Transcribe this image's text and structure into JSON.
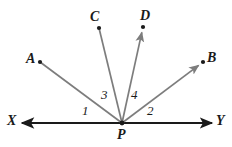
{
  "figure": {
    "width": 232,
    "height": 147,
    "background": "#ffffff",
    "ray_color": "#7d7d7d",
    "line_color": "#1a1a1a",
    "label_color": "#1a1a1a"
  },
  "vertex": {
    "name": "P",
    "label": "P",
    "x": 122,
    "y": 123
  },
  "line_xy": {
    "start_label": "X",
    "end_label": "Y",
    "x1": 22,
    "y1": 123,
    "x2": 212,
    "y2": 123
  },
  "rays": [
    {
      "label": "A",
      "endpoint_x": 40,
      "endpoint_y": 62,
      "arrow_direction": "toward-vertex"
    },
    {
      "label": "C",
      "endpoint_x": 99,
      "endpoint_y": 28,
      "arrow_direction": "toward-vertex"
    },
    {
      "label": "D",
      "endpoint_x": 143,
      "endpoint_y": 27,
      "arrow_direction": "away-from-vertex"
    },
    {
      "label": "B",
      "endpoint_x": 203,
      "endpoint_y": 62,
      "arrow_direction": "away-from-vertex"
    }
  ],
  "point_labels": {
    "a": "A",
    "b": "B",
    "c": "C",
    "d": "D",
    "p": "P",
    "x": "X",
    "y": "Y"
  },
  "angle_labels": [
    {
      "text": "1",
      "x": 82,
      "y": 104
    },
    {
      "text": "3",
      "x": 101,
      "y": 88
    },
    {
      "text": "4",
      "x": 131,
      "y": 88
    },
    {
      "text": "2",
      "x": 147,
      "y": 104
    }
  ]
}
